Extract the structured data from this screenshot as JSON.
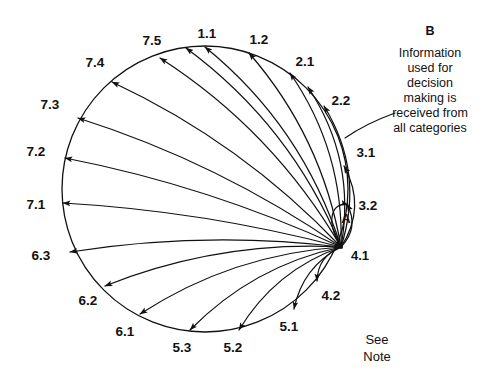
{
  "figure": {
    "title_hidden": "",
    "background_color": "#ffffff",
    "ink_color": "#111111",
    "circle": {
      "cx": 205,
      "cy": 189,
      "r": 143
    },
    "hub": {
      "x": 341,
      "y": 247,
      "label": "4.1",
      "marker_label": "A"
    }
  },
  "nodes": [
    {
      "id": "1.1",
      "label": "1.1",
      "label_x": 207,
      "label_y": 34,
      "tip_x": 205,
      "tip_y": 47,
      "angle": -90,
      "bow": 0.3
    },
    {
      "id": "1.2",
      "label": "1.2",
      "label_x": 259,
      "label_y": 40,
      "tip_x": 249,
      "tip_y": 53,
      "angle": -72,
      "bow": 0.28
    },
    {
      "id": "2.1",
      "label": "2.1",
      "label_x": 305,
      "label_y": 62,
      "tip_x": 290,
      "tip_y": 73,
      "angle": -53,
      "bow": 0.33
    },
    {
      "id": "2.2",
      "label": "2.2",
      "label_x": 341,
      "label_y": 101,
      "tip_x": 324,
      "tip_y": 106,
      "angle": -33,
      "bow": 0.46
    },
    {
      "id": "3.1",
      "label": "3.1",
      "label_x": 366,
      "label_y": 153,
      "tip_x": 344,
      "tip_y": 166,
      "angle": -11,
      "bow": 0.6
    },
    {
      "id": "3.2",
      "label": "3.2",
      "label_x": 368,
      "label_y": 206,
      "tip_x": 347,
      "tip_y": 204,
      "angle": 6,
      "bow": 0.72
    },
    {
      "id": "4.2",
      "label": "4.2",
      "label_x": 331,
      "label_y": 296,
      "tip_x": 317,
      "tip_y": 281,
      "angle": 43,
      "bow": 0.66
    },
    {
      "id": "5.1",
      "label": "5.1",
      "label_x": 289,
      "label_y": 327,
      "tip_x": 294,
      "tip_y": 309,
      "angle": 60,
      "bow": 0.48
    },
    {
      "id": "5.2",
      "label": "5.2",
      "label_x": 233,
      "label_y": 348,
      "tip_x": 239,
      "tip_y": 330,
      "angle": 76,
      "bow": 0.36
    },
    {
      "id": "5.3",
      "label": "5.3",
      "label_x": 182,
      "label_y": 348,
      "tip_x": 190,
      "tip_y": 330,
      "angle": 96,
      "bow": 0.3
    },
    {
      "id": "6.1",
      "label": "6.1",
      "label_x": 125,
      "label_y": 332,
      "tip_x": 140,
      "tip_y": 314,
      "angle": 114,
      "bow": 0.26
    },
    {
      "id": "6.2",
      "label": "6.2",
      "label_x": 88,
      "label_y": 301,
      "tip_x": 105,
      "tip_y": 286,
      "angle": 131,
      "bow": 0.22
    },
    {
      "id": "6.3",
      "label": "6.3",
      "label_x": 41,
      "label_y": 256,
      "tip_x": 70,
      "tip_y": 252,
      "angle": 154,
      "bow": 0.14
    },
    {
      "id": "7.1",
      "label": "7.1",
      "label_x": 36,
      "label_y": 205,
      "tip_x": 63,
      "tip_y": 203,
      "angle": 172,
      "bow": 0.1
    },
    {
      "id": "7.2",
      "label": "7.2",
      "label_x": 36,
      "label_y": 152,
      "tip_x": 65,
      "tip_y": 158,
      "angle": -168,
      "bow": 0.12
    },
    {
      "id": "7.3",
      "label": "7.3",
      "label_x": 50,
      "label_y": 105,
      "tip_x": 78,
      "tip_y": 118,
      "angle": -152,
      "bow": 0.15
    },
    {
      "id": "7.4",
      "label": "7.4",
      "label_x": 95,
      "label_y": 63,
      "tip_x": 112,
      "tip_y": 82,
      "angle": -133,
      "bow": 0.19
    },
    {
      "id": "7.5",
      "label": "7.5",
      "label_x": 152,
      "label_y": 41,
      "tip_x": 160,
      "tip_y": 58,
      "angle": -113,
      "bow": 0.24
    }
  ],
  "extra_nodes": [
    {
      "id": "1.1b",
      "tip_x": 186,
      "tip_y": 48,
      "angle": -97,
      "bow": 0.28
    },
    {
      "id": "2.1b",
      "tip_x": 308,
      "tip_y": 87,
      "angle": -45,
      "bow": 0.4
    }
  ],
  "callout_b": {
    "letter": "B",
    "x": 430,
    "y": 32,
    "lines": [
      "Information",
      "used for",
      "decision",
      "making is",
      "received from",
      "all categories"
    ],
    "leader": {
      "x1": 395,
      "y1": 113,
      "x2": 345,
      "y2": 138
    }
  },
  "note": {
    "x": 377,
    "y": 341,
    "lines": [
      "See",
      "Note"
    ]
  }
}
